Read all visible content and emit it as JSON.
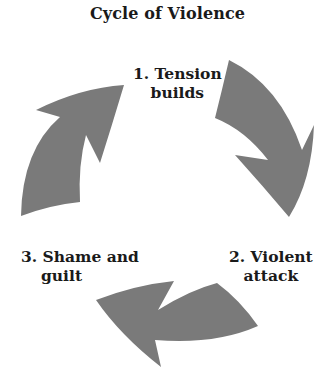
{
  "title": "Cycle of Violence",
  "stages": [
    {
      "number": "1.",
      "line1": "1. Tension",
      "line2": "builds"
    },
    {
      "number": "2.",
      "line1": "2. Violent",
      "line2": "attack"
    },
    {
      "number": "3.",
      "line1": "3. Shame and",
      "line2": "guilt"
    }
  ],
  "arrow_color": "#7a7a7a",
  "arrows": [
    "tension-to-attack-arrow",
    "attack-to-shame-arrow",
    "shame-to-tension-arrow"
  ]
}
